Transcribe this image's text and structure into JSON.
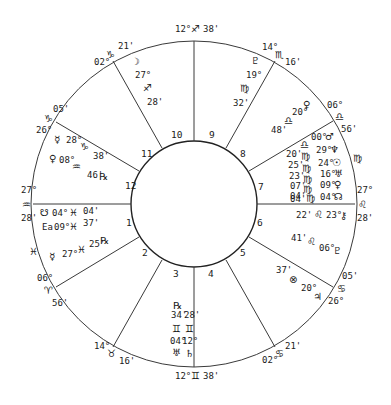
{
  "chart": {
    "center": [
      194,
      204
    ],
    "outer_radius": 163,
    "inner_radius": 63,
    "line_color": "#3a3a3a"
  },
  "cusps": [
    {
      "name": "mc",
      "deg": "12°",
      "sign": "♐",
      "min": "38'"
    },
    {
      "name": "ic",
      "deg": "12°",
      "sign": "♊",
      "min": "38'"
    },
    {
      "name": "asc",
      "deg": "27°",
      "sign": "♒",
      "min": "28'"
    },
    {
      "name": "dsc",
      "deg": "27°",
      "sign": "♌",
      "min": "28'"
    },
    {
      "name": "cusp11",
      "deg": "02°",
      "sign": "♑",
      "min": "21'"
    },
    {
      "name": "cusp12",
      "deg": "26°",
      "sign": "♑",
      "min": "05'"
    },
    {
      "name": "cusp9",
      "deg": "14°",
      "sign": "♏",
      "min": "16'"
    },
    {
      "name": "cusp8",
      "deg": "06°",
      "sign": "♎",
      "min": "56'"
    },
    {
      "name": "cusp2",
      "deg": "06°",
      "sign": "♈",
      "min": "56'"
    },
    {
      "name": "cusp3",
      "deg": "14°",
      "sign": "♉",
      "min": "16'"
    },
    {
      "name": "cusp5",
      "deg": "02°",
      "sign": "♋",
      "min": "21'"
    },
    {
      "name": "cusp6",
      "deg": "26°",
      "sign": "♋",
      "min": "05'"
    }
  ],
  "houses": [
    "1",
    "2",
    "3",
    "4",
    "5",
    "6",
    "7",
    "8",
    "9",
    "10",
    "11",
    "12"
  ],
  "intercepted": {
    "house1": "♓",
    "house7": "♍"
  },
  "planets": {
    "moon": {
      "glyph": "☽",
      "deg": "27°",
      "sign": "♐",
      "min": "28'"
    },
    "pluto_h9": {
      "glyph": "♇",
      "deg": "19°",
      "sign": "♍",
      "min": "32'"
    },
    "venus_h8": {
      "glyph": "♀",
      "deg": "20°",
      "sign": "♎",
      "min": "48'"
    },
    "mars": {
      "glyph": "♂",
      "deg": "00°",
      "sign": "♎",
      "min": "20'"
    },
    "neptune": {
      "glyph": "♆",
      "deg": "29°",
      "sign": "♍",
      "min": "25'"
    },
    "sun": {
      "glyph": "☉",
      "deg": "24°",
      "sign": "♍",
      "min": "23'"
    },
    "uranus_h7": {
      "glyph": "♅",
      "deg": "16°",
      "sign": "♍",
      "min": "07'"
    },
    "venus": {
      "glyph": "♀",
      "deg": "09°",
      "sign": "♍",
      "min": "04'"
    },
    "node_h7": {
      "glyph": "☊",
      "deg": "04°",
      "sign": "♍",
      "min": "04'"
    },
    "chiron": {
      "glyph": "⚷",
      "deg": "23°",
      "sign": "♌",
      "min": "22'"
    },
    "pluto_h6": {
      "glyph": "♇",
      "deg": "06°",
      "sign": "♌",
      "min": "41'"
    },
    "fortuna": {
      "glyph": "⊗",
      "deg": "20°",
      "sign": "♋",
      "min": "37'"
    },
    "jupiter": {
      "glyph": "♃",
      "label": "20°"
    },
    "mercury_h12": {
      "glyph": "☿",
      "deg": "28°",
      "sign": "♑",
      "min": "38'"
    },
    "venus_h12": {
      "glyph": "♀",
      "deg": "08°",
      "sign": "♒",
      "min": "46'",
      "retro": "℞"
    },
    "south_node": {
      "glyph": "☋",
      "deg": "04°",
      "sign": "♓",
      "min": "04'"
    },
    "ea": {
      "glyph": "Ea",
      "deg": "09°",
      "sign": "♓",
      "min": "37'"
    },
    "mercury_h1": {
      "glyph": "☿",
      "deg": "27°",
      "sign": "♓",
      "min": "25'",
      "retro": "℞"
    },
    "uranus_h3": {
      "glyph": "♅",
      "deg": "04°",
      "sign": "♊",
      "min": "34'",
      "retro": "℞"
    },
    "saturn": {
      "glyph": "♄",
      "deg": "12°",
      "sign": "♊",
      "min": "28'"
    }
  }
}
